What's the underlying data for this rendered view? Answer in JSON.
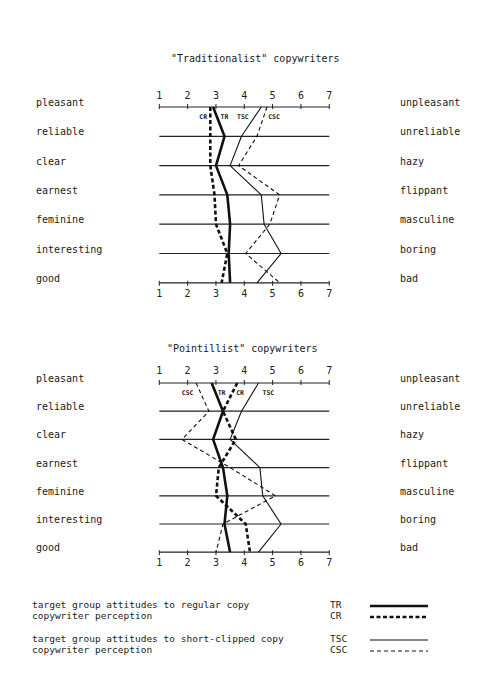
{
  "chart_data": [
    {
      "type": "line",
      "title": "\"Traditionalist\" copywriters",
      "scale_ticks": [
        "1",
        "2",
        "3",
        "4",
        "5",
        "6",
        "7"
      ],
      "xlim": [
        1,
        7
      ],
      "left_labels": [
        "pleasant",
        "reliable",
        "clear",
        "earnest",
        "feminine",
        "interesting",
        "good"
      ],
      "right_labels": [
        "unpleasant",
        "unreliable",
        "hazy",
        "flippant",
        "masculine",
        "boring",
        "bad"
      ],
      "series": [
        {
          "name": "TR",
          "values": [
            2.9,
            3.3,
            3.0,
            3.4,
            3.5,
            3.45,
            3.5
          ]
        },
        {
          "name": "CR",
          "values": [
            2.8,
            2.8,
            2.8,
            2.95,
            3.0,
            3.4,
            3.2
          ]
        },
        {
          "name": "TSC",
          "values": [
            4.6,
            3.9,
            3.5,
            4.6,
            4.7,
            5.3,
            4.45
          ]
        },
        {
          "name": "CSC",
          "values": [
            4.8,
            4.45,
            3.8,
            5.25,
            4.9,
            4.05,
            5.25
          ]
        }
      ],
      "annotations": [
        "CR",
        "TR",
        "TSC",
        "CSC"
      ]
    },
    {
      "type": "line",
      "title": "\"Pointillist\" copywriters",
      "scale_ticks": [
        "1",
        "2",
        "3",
        "4",
        "5",
        "6",
        "7"
      ],
      "xlim": [
        1,
        7
      ],
      "left_labels": [
        "pleasant",
        "reliable",
        "clear",
        "earnest",
        "feminine",
        "interesting",
        "good"
      ],
      "right_labels": [
        "unpleasant",
        "unreliable",
        "hazy",
        "flippant",
        "masculine",
        "boring",
        "bad"
      ],
      "series": [
        {
          "name": "TR",
          "values": [
            2.85,
            3.25,
            2.9,
            3.25,
            3.4,
            3.3,
            3.5
          ]
        },
        {
          "name": "CR",
          "values": [
            3.75,
            3.25,
            3.7,
            3.1,
            3.0,
            4.05,
            4.2
          ]
        },
        {
          "name": "TSC",
          "values": [
            4.5,
            3.9,
            3.5,
            4.55,
            4.65,
            5.3,
            4.5
          ]
        },
        {
          "name": "CSC",
          "values": [
            2.3,
            2.75,
            1.8,
            3.5,
            5.1,
            3.25,
            3.0
          ]
        }
      ],
      "annotations": [
        "CSC",
        "TR",
        "CR",
        "TSC"
      ]
    }
  ],
  "legend": [
    {
      "text": "target group attitudes to regular copy",
      "code": "TR",
      "style": "thick-solid"
    },
    {
      "text": "copywriter perception",
      "code": "CR",
      "style": "thick-dashed"
    },
    {
      "text": "target group attitudes to short-clipped copy",
      "code": "TSC",
      "style": "thin-solid"
    },
    {
      "text": "copywriter perception",
      "code": "CSC",
      "style": "thin-dashed"
    }
  ]
}
